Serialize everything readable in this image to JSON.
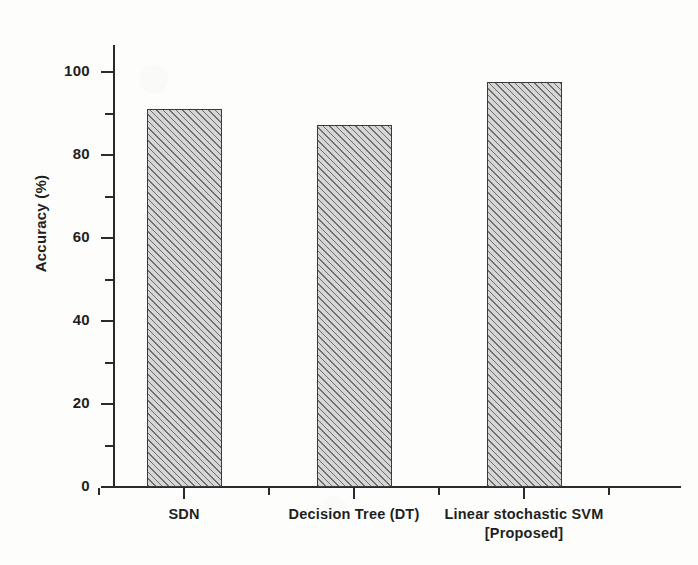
{
  "chart_data": {
    "type": "bar",
    "title": "",
    "xlabel": "",
    "ylabel": "Accuracy (%)",
    "categories": [
      "SDN",
      "Decision Tree (DT)",
      "Linear stochastic SVM\n[Proposed]"
    ],
    "category_lines": [
      [
        "SDN"
      ],
      [
        "Decision Tree (DT)"
      ],
      [
        "Linear stochastic SVM",
        "[Proposed]"
      ]
    ],
    "values": [
      91.1,
      87.2,
      97.6
    ],
    "ylim": [
      0,
      105
    ],
    "y_major_ticks": [
      0,
      20,
      40,
      60,
      80,
      100
    ],
    "y_minor_ticks": [
      10,
      30,
      50,
      70,
      90
    ],
    "y_tick_labels": [
      "0",
      "20",
      "40",
      "60",
      "80",
      "100"
    ],
    "grid": false,
    "legend": null,
    "bar_fill": "#d6d6d6",
    "bar_hatch": "diagonal-forward",
    "bar_edge_color": "#3a3a3a",
    "axis_color": "#2b2b2b",
    "background": "#fdfdfc"
  },
  "axis": {
    "y_title": "Accuracy (%)"
  }
}
